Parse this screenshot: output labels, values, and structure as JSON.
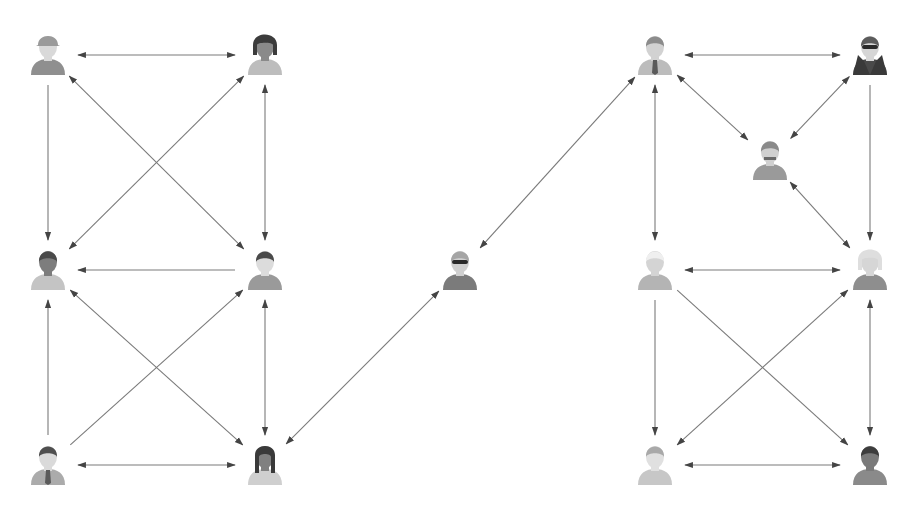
{
  "diagram": {
    "title": "",
    "type": "network-graph",
    "colors": {
      "edge": "#7a7a7a",
      "arrowhead": "#444444",
      "background": "#ffffff"
    },
    "nodes": [
      {
        "id": "L1",
        "icon": "person-cap-icon",
        "x": 48,
        "y": 55,
        "skin": "#d9d9d9",
        "hair": "#9a9a9a",
        "body": "#8f8f8f",
        "cluster": "left"
      },
      {
        "id": "L2",
        "icon": "person-woman-bob-icon",
        "x": 265,
        "y": 55,
        "skin": "#8a8a8a",
        "hair": "#3c3c3c",
        "body": "#bdbdbd",
        "cluster": "left"
      },
      {
        "id": "L3",
        "icon": "person-dark-man-icon",
        "x": 48,
        "y": 270,
        "skin": "#7d7d7d",
        "hair": "#4a4a4a",
        "body": "#c4c4c4",
        "cluster": "left"
      },
      {
        "id": "L4",
        "icon": "person-jacket-man-icon",
        "x": 265,
        "y": 270,
        "skin": "#dcdcdc",
        "hair": "#4a4a4a",
        "body": "#9a9a9a",
        "cluster": "left"
      },
      {
        "id": "L5",
        "icon": "person-suit-tie-icon",
        "x": 48,
        "y": 465,
        "skin": "#dadada",
        "hair": "#4f4f4f",
        "body": "#ababab",
        "cluster": "left"
      },
      {
        "id": "L6",
        "icon": "person-woman-long-hair-icon",
        "x": 265,
        "y": 465,
        "skin": "#808080",
        "hair": "#3a3a3a",
        "body": "#cfcfcf",
        "cluster": "left"
      },
      {
        "id": "C",
        "icon": "person-sunglasses-icon",
        "x": 460,
        "y": 270,
        "skin": "#cfcfcf",
        "hair": "#a5a5a5",
        "body": "#7b7b7b",
        "cluster": "center"
      },
      {
        "id": "R1",
        "icon": "person-businessman-tie-icon",
        "x": 655,
        "y": 55,
        "skin": "#d2d2d2",
        "hair": "#8c8c8c",
        "body": "#bcbcbc",
        "cluster": "right"
      },
      {
        "id": "R2",
        "icon": "person-spy-icon",
        "x": 870,
        "y": 55,
        "skin": "#d6d6d6",
        "hair": "#5c5c5c",
        "body": "#4a4a4a",
        "cluster": "right"
      },
      {
        "id": "R3",
        "icon": "person-mustache-icon",
        "x": 770,
        "y": 160,
        "skin": "#d0d0d0",
        "hair": "#8a8a8a",
        "body": "#9a9a9a",
        "cluster": "right"
      },
      {
        "id": "R4",
        "icon": "person-white-hair-icon",
        "x": 655,
        "y": 270,
        "skin": "#d4d4d4",
        "hair": "#efefef",
        "body": "#b4b4b4",
        "cluster": "right"
      },
      {
        "id": "R5",
        "icon": "person-curly-woman-icon",
        "x": 870,
        "y": 270,
        "skin": "#d6d6d6",
        "hair": "#dedede",
        "body": "#8e8e8e",
        "cluster": "right"
      },
      {
        "id": "R6",
        "icon": "person-woman-bun-icon",
        "x": 655,
        "y": 465,
        "skin": "#e0e0e0",
        "hair": "#a9a9a9",
        "body": "#c7c7c7",
        "cluster": "right"
      },
      {
        "id": "R7",
        "icon": "person-dark-man-icon",
        "x": 870,
        "y": 465,
        "skin": "#7a7a7a",
        "hair": "#3d3d3d",
        "body": "#8a8a8a",
        "cluster": "right"
      }
    ],
    "edges": [
      {
        "from": "L1",
        "to": "L2",
        "arrow_start": true,
        "arrow_end": true
      },
      {
        "from": "L1",
        "to": "L3",
        "arrow_start": false,
        "arrow_end": true
      },
      {
        "from": "L1",
        "to": "L4",
        "arrow_start": true,
        "arrow_end": true
      },
      {
        "from": "L2",
        "to": "L3",
        "arrow_start": true,
        "arrow_end": true
      },
      {
        "from": "L2",
        "to": "L4",
        "arrow_start": true,
        "arrow_end": true
      },
      {
        "from": "L4",
        "to": "L3",
        "arrow_start": false,
        "arrow_end": true
      },
      {
        "from": "L5",
        "to": "L3",
        "arrow_start": false,
        "arrow_end": true
      },
      {
        "from": "L5",
        "to": "L4",
        "arrow_start": false,
        "arrow_end": true
      },
      {
        "from": "L3",
        "to": "L6",
        "arrow_start": true,
        "arrow_end": true
      },
      {
        "from": "L4",
        "to": "L6",
        "arrow_start": true,
        "arrow_end": true
      },
      {
        "from": "L5",
        "to": "L6",
        "arrow_start": true,
        "arrow_end": true
      },
      {
        "from": "L6",
        "to": "C",
        "arrow_start": true,
        "arrow_end": true
      },
      {
        "from": "C",
        "to": "R1",
        "arrow_start": true,
        "arrow_end": true
      },
      {
        "from": "R1",
        "to": "R2",
        "arrow_start": true,
        "arrow_end": true
      },
      {
        "from": "R1",
        "to": "R3",
        "arrow_start": true,
        "arrow_end": true
      },
      {
        "from": "R2",
        "to": "R3",
        "arrow_start": true,
        "arrow_end": true
      },
      {
        "from": "R3",
        "to": "R5",
        "arrow_start": true,
        "arrow_end": true
      },
      {
        "from": "R1",
        "to": "R4",
        "arrow_start": true,
        "arrow_end": true
      },
      {
        "from": "R2",
        "to": "R5",
        "arrow_start": false,
        "arrow_end": true
      },
      {
        "from": "R4",
        "to": "R5",
        "arrow_start": true,
        "arrow_end": true
      },
      {
        "from": "R4",
        "to": "R6",
        "arrow_start": false,
        "arrow_end": true
      },
      {
        "from": "R4",
        "to": "R7",
        "arrow_start": false,
        "arrow_end": true
      },
      {
        "from": "R5",
        "to": "R6",
        "arrow_start": true,
        "arrow_end": true
      },
      {
        "from": "R5",
        "to": "R7",
        "arrow_start": true,
        "arrow_end": true
      },
      {
        "from": "R6",
        "to": "R7",
        "arrow_start": true,
        "arrow_end": true
      }
    ]
  }
}
